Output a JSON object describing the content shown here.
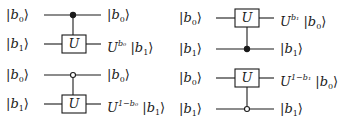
{
  "circuits": [
    {
      "id": "left-top",
      "gate_label": "U",
      "control_type": "filled",
      "inputs": [
        {
          "ket": "b",
          "sub": "0"
        },
        {
          "ket": "b",
          "sub": "1"
        }
      ],
      "outputs": [
        {
          "text": "|b₀⟩"
        },
        {
          "text": "U^{b₀}|b₁⟩",
          "base": "U",
          "sup": "b₀",
          "ket": "b",
          "sub": "1"
        }
      ]
    },
    {
      "id": "left-bottom",
      "gate_label": "U",
      "control_type": "open",
      "inputs": [
        {
          "ket": "b",
          "sub": "0"
        },
        {
          "ket": "b",
          "sub": "1"
        }
      ],
      "outputs": [
        {
          "text": "|b₀⟩"
        },
        {
          "text": "U^{1−b₀}|b₁⟩",
          "base": "U",
          "sup": "1−b₀",
          "ket": "b",
          "sub": "1"
        }
      ]
    },
    {
      "id": "right-top",
      "gate_label": "U",
      "control_type": "filled",
      "inputs": [
        {
          "ket": "b",
          "sub": "0"
        },
        {
          "ket": "b",
          "sub": "1"
        }
      ],
      "outputs": [
        {
          "text": "U^{b₁}|b₀⟩",
          "base": "U",
          "sup": "b₁",
          "ket": "b",
          "sub": "0"
        },
        {
          "text": "|b₁⟩"
        }
      ]
    },
    {
      "id": "right-bottom",
      "gate_label": "U",
      "control_type": "open",
      "inputs": [
        {
          "ket": "b",
          "sub": "0"
        },
        {
          "ket": "b",
          "sub": "1"
        }
      ],
      "outputs": [
        {
          "text": "U^{1−b₁}|b₀⟩",
          "base": "U",
          "sup": "1−b₁",
          "ket": "b",
          "sub": "0"
        },
        {
          "text": "|b₁⟩"
        }
      ]
    }
  ],
  "glyphs": {
    "bar": "|",
    "rangle": "⟩",
    "b": "b",
    "U": "U",
    "sub0": "0",
    "sub1": "1",
    "sup_b0": "b₀",
    "sup_b1": "b₁",
    "sup_1mb0": "1−b₀",
    "sup_1mb1": "1−b₁"
  },
  "colors": {
    "line": "#1a1a1a",
    "background": "#ffffff"
  }
}
